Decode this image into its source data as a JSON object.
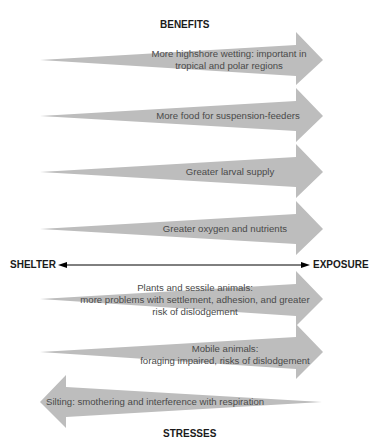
{
  "colors": {
    "arrow_fill": "#bdbdbd",
    "text": "#4a4a4a",
    "heading": "#1a1a1a"
  },
  "headings": {
    "top": "BENEFITS",
    "bottom": "STRESSES"
  },
  "axis": {
    "left_label": "SHELTER",
    "right_label": "EXPOSURE"
  },
  "benefits": [
    {
      "lines": [
        "More highshore wetting: important in",
        "tropical and polar regions"
      ]
    },
    {
      "lines": [
        "More food for suspension-feeders"
      ]
    },
    {
      "lines": [
        "Greater larval supply"
      ]
    },
    {
      "lines": [
        "Greater oxygen and nutrients"
      ]
    }
  ],
  "stresses": [
    {
      "lines": [
        "Plants and sessile animals:",
        "more problems with settlement, adhesion, and greater",
        "risk of dislodgement"
      ]
    },
    {
      "lines": [
        "Mobile animals:",
        "foraging impaired, risks of dislodgement"
      ]
    },
    {
      "lines": [
        "Silting: smothering and interference with respiration"
      ]
    }
  ]
}
